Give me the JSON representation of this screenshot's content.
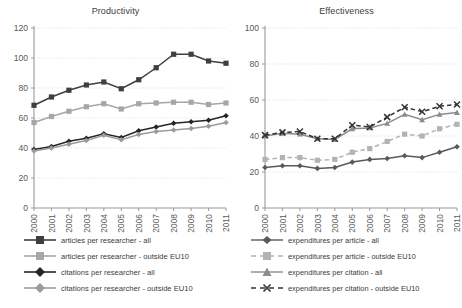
{
  "chart_data": [
    {
      "type": "line",
      "title": "Productivity",
      "xlabel": "",
      "ylabel": "",
      "ylim": [
        0,
        120
      ],
      "yticks": [
        0,
        20,
        40,
        60,
        80,
        100,
        120
      ],
      "grid": true,
      "legend_position": "bottom",
      "categories": [
        "2000",
        "2001",
        "2002",
        "2003",
        "2004",
        "2005",
        "2006",
        "2007",
        "2008",
        "2009",
        "2010",
        "2011"
      ],
      "series": [
        {
          "name": "articles per researcher - all",
          "marker": "square",
          "color": "#3f3f3f",
          "dash": "solid",
          "values": [
            68.5,
            74,
            78.5,
            82,
            84,
            79.5,
            85.5,
            93.5,
            102.5,
            102.5,
            98,
            96.5
          ]
        },
        {
          "name": "articles per researcher - outside EU10",
          "marker": "square",
          "color": "#a6a6a6",
          "dash": "solid",
          "values": [
            57,
            61,
            64.5,
            67.5,
            69.5,
            66,
            69.5,
            70,
            70.5,
            70.5,
            69,
            70
          ]
        },
        {
          "name": "citations per researcher - all",
          "marker": "diamond",
          "color": "#262626",
          "dash": "solid",
          "values": [
            39,
            41,
            44.5,
            46.5,
            49.5,
            47,
            51.5,
            54,
            56.5,
            57.5,
            58.5,
            61.5
          ]
        },
        {
          "name": "citations per researcher - outside EU10",
          "marker": "diamond",
          "color": "#9b9b9b",
          "dash": "solid",
          "values": [
            38,
            40,
            42.5,
            45,
            48.5,
            45.5,
            49,
            51,
            52,
            53,
            54.5,
            57
          ]
        }
      ]
    },
    {
      "type": "line",
      "title": "Effectiveness",
      "xlabel": "",
      "ylabel": "",
      "ylim": [
        0,
        100
      ],
      "yticks": [
        0,
        20,
        40,
        60,
        80,
        100
      ],
      "grid": true,
      "legend_position": "bottom",
      "categories": [
        "2000",
        "2001",
        "2002",
        "2003",
        "2004",
        "2005",
        "2006",
        "2007",
        "2008",
        "2009",
        "2010",
        "2011"
      ],
      "series": [
        {
          "name": "expenditures per article - all",
          "marker": "diamond",
          "color": "#595959",
          "dash": "solid",
          "values": [
            22.5,
            23.5,
            23.5,
            22,
            22.5,
            25.5,
            27,
            27.5,
            29,
            28,
            31,
            34
          ]
        },
        {
          "name": "expenditures per article - outside EU10",
          "marker": "square",
          "color": "#b3b3b3",
          "dash": "dashed",
          "values": [
            27,
            28,
            28,
            26.5,
            27,
            31,
            33,
            37,
            41,
            40,
            44,
            46.5
          ]
        },
        {
          "name": "expenditures per citation - all",
          "marker": "triangle",
          "color": "#8c8c8c",
          "dash": "solid",
          "values": [
            40,
            41.5,
            41,
            38.5,
            38,
            44,
            44.5,
            47,
            52,
            49,
            52,
            53
          ]
        },
        {
          "name": "expenditures per citation - outside EU10",
          "marker": "x",
          "color": "#333333",
          "dash": "dashed",
          "values": [
            40.5,
            42,
            42.5,
            38.5,
            38.5,
            46,
            45,
            50.5,
            56,
            53.5,
            56.5,
            57.5
          ]
        }
      ]
    }
  ]
}
